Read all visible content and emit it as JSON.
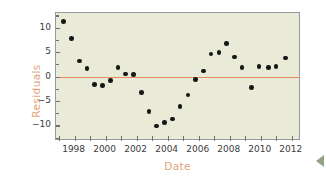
{
  "figure": {
    "background_color": "#ffffff",
    "plot_background_color": "#e9ead8",
    "frame_color": "#9a9a9a",
    "accent_color": "#e0a478",
    "zero_line_color": "#e38a5c",
    "point_color": "#161616"
  },
  "axes": {
    "ylabel": "Residuals",
    "xlabel": "Date",
    "y_ticks": [
      {
        "value": 10,
        "label": "10"
      },
      {
        "value": 5,
        "label": "5"
      },
      {
        "value": 0,
        "label": "0"
      },
      {
        "value": -5,
        "label": "−5"
      },
      {
        "value": -10,
        "label": "−10"
      }
    ],
    "y_minor_ticks": [
      12.5,
      7.5,
      2.5,
      -2.5,
      -7.5,
      -12.5
    ],
    "x_ticks": [
      {
        "value": 1997,
        "label": ""
      },
      {
        "value": 1998,
        "label": "1998"
      },
      {
        "value": 1999,
        "label": ""
      },
      {
        "value": 2000,
        "label": "2000"
      },
      {
        "value": 2001,
        "label": ""
      },
      {
        "value": 2002,
        "label": "2002"
      },
      {
        "value": 2003,
        "label": ""
      },
      {
        "value": 2004,
        "label": "2004"
      },
      {
        "value": 2005,
        "label": ""
      },
      {
        "value": 2006,
        "label": "2006"
      },
      {
        "value": 2007,
        "label": ""
      },
      {
        "value": 2008,
        "label": "2008"
      },
      {
        "value": 2009,
        "label": ""
      },
      {
        "value": 2010,
        "label": "2010"
      },
      {
        "value": 2011,
        "label": ""
      },
      {
        "value": 2012,
        "label": "2012"
      }
    ],
    "xlim": [
      1996.8,
      1012.6
    ],
    "ylim": [
      -13.2,
      13.0
    ]
  },
  "chart_data": {
    "type": "scatter",
    "title": "",
    "subtitle": "",
    "xlabel": "Date",
    "ylabel": "Residuals",
    "xlim": [
      1996.8,
      2012.6
    ],
    "ylim": [
      -13.2,
      13.0
    ],
    "grid": false,
    "legend": null,
    "annotations": [
      {
        "type": "hline",
        "y": 0,
        "color": "#e38a5c",
        "label": "zero residual reference line"
      }
    ],
    "x": [
      1997.3,
      1997.8,
      1998.3,
      1998.8,
      1999.3,
      1999.8,
      2000.3,
      2000.8,
      2001.3,
      2001.8,
      2002.3,
      2002.8,
      2003.3,
      2003.8,
      2004.3,
      2004.8,
      2005.3,
      2005.8,
      2006.3,
      2006.8,
      2007.3,
      2007.8,
      2008.3,
      2008.8,
      2009.4,
      2009.9,
      2010.5,
      2011.0,
      2011.6
    ],
    "y": [
      11.3,
      7.8,
      3.2,
      1.7,
      -1.6,
      -1.8,
      -0.8,
      1.8,
      0.5,
      0.4,
      -3.3,
      -7.2,
      -10.1,
      -9.4,
      -8.7,
      -6.1,
      -3.8,
      -0.6,
      1.1,
      4.6,
      4.9,
      6.8,
      4.0,
      1.8,
      -2.2,
      2.1,
      1.8,
      2.1,
      3.8
    ],
    "points": [
      {
        "x": 1997.3,
        "y": 11.3
      },
      {
        "x": 1997.8,
        "y": 7.8
      },
      {
        "x": 1998.3,
        "y": 3.2
      },
      {
        "x": 1998.8,
        "y": 1.7
      },
      {
        "x": 1999.3,
        "y": -1.6
      },
      {
        "x": 1999.8,
        "y": -1.8
      },
      {
        "x": 2000.3,
        "y": -0.8
      },
      {
        "x": 2000.8,
        "y": 1.8
      },
      {
        "x": 2001.3,
        "y": 0.5
      },
      {
        "x": 2001.8,
        "y": 0.4
      },
      {
        "x": 2002.3,
        "y": -3.3
      },
      {
        "x": 2002.8,
        "y": -7.2
      },
      {
        "x": 2003.3,
        "y": -10.1
      },
      {
        "x": 2003.8,
        "y": -9.4
      },
      {
        "x": 2004.3,
        "y": -8.7
      },
      {
        "x": 2004.8,
        "y": -6.1
      },
      {
        "x": 2005.3,
        "y": -3.8
      },
      {
        "x": 2005.8,
        "y": -0.6
      },
      {
        "x": 2006.3,
        "y": 1.1
      },
      {
        "x": 2006.8,
        "y": 4.6
      },
      {
        "x": 2007.3,
        "y": 4.9
      },
      {
        "x": 2007.8,
        "y": 6.8
      },
      {
        "x": 2008.3,
        "y": 4.0
      },
      {
        "x": 2008.8,
        "y": 1.8
      },
      {
        "x": 2009.4,
        "y": -2.2
      },
      {
        "x": 2009.9,
        "y": 2.1
      },
      {
        "x": 2010.5,
        "y": 1.8
      },
      {
        "x": 2011.0,
        "y": 2.1
      },
      {
        "x": 2011.6,
        "y": 3.8
      }
    ]
  }
}
